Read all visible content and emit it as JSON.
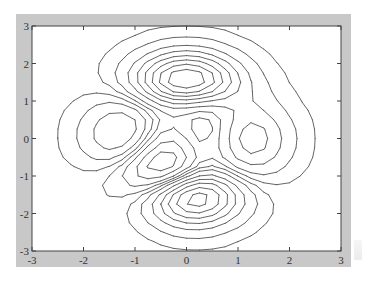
{
  "chart_data": {
    "type": "contour",
    "title": "",
    "xlabel": "",
    "ylabel": "",
    "function": "peaks",
    "xlim": [
      -3,
      3
    ],
    "ylim": [
      -3,
      3
    ],
    "grid": false,
    "legend": null,
    "x_ticks": [
      -3,
      -2,
      -1,
      0,
      1,
      2,
      3
    ],
    "y_ticks": [
      -3,
      -2,
      -1,
      0,
      1,
      2,
      3
    ],
    "x_tick_labels": [
      "-3",
      "-2",
      "-1",
      "0",
      "1",
      "2",
      "3"
    ],
    "y_tick_labels": [
      "-3",
      "-2",
      "-1",
      "0",
      "1",
      "2",
      "3"
    ],
    "grid_resolution": 25,
    "levels": [
      -6,
      -5,
      -4,
      -3,
      -2,
      -1,
      -0.3,
      0.3,
      1,
      2,
      3,
      4,
      5,
      6,
      7
    ],
    "features": [
      {
        "type": "maximum",
        "x": 0.0,
        "y": 1.58,
        "value": 8.1
      },
      {
        "type": "minimum",
        "x": 0.23,
        "y": -1.63,
        "value": -6.5
      },
      {
        "type": "maximum",
        "x": -1.35,
        "y": 0.2,
        "value": 3.6
      },
      {
        "type": "minimum",
        "x": -0.46,
        "y": -0.63,
        "value": -3.0
      },
      {
        "type": "maximum",
        "x": 1.29,
        "y": 0.0,
        "value": 3.0
      },
      {
        "type": "minimum",
        "x": 0.3,
        "y": 0.3,
        "value": 0.5
      }
    ]
  },
  "colors": {
    "frame": "#c8c8c8",
    "plot_background": "#ffffff",
    "contour_line": "#555555",
    "axis_line": "#444444"
  }
}
